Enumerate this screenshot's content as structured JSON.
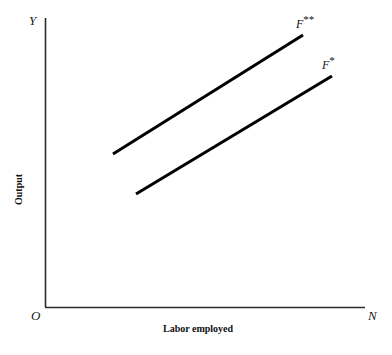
{
  "figure": {
    "background_color": "#ffffff",
    "width": 392,
    "height": 355,
    "axis_color": "#2b2b2b",
    "curve_color": "#000000"
  },
  "axes": {
    "y_endpoint_label": "Y",
    "x_endpoint_label": "N",
    "origin_label": "O",
    "y_title": "Output",
    "x_title": "Labor employed"
  },
  "curves": {
    "upper": {
      "label_base": "F",
      "label_stars": "**",
      "label_full": "F**"
    },
    "lower": {
      "label_base": "F",
      "label_stars": "*",
      "label_full": "F*"
    }
  },
  "chart_data": {
    "type": "line",
    "title": "",
    "xlabel": "Labor employed",
    "ylabel": "Output",
    "xlim": [
      0,
      1
    ],
    "ylim": [
      0,
      1
    ],
    "grid": false,
    "legend": "inline-end-labels",
    "axis_endpoint_labels": {
      "x": "N",
      "y": "Y",
      "origin": "O"
    },
    "annotations": [
      {
        "text": "F**",
        "x_px": 296,
        "y_px": 14
      },
      {
        "text": "F*",
        "x_px": 322,
        "y_px": 55
      }
    ],
    "series": [
      {
        "name": "F**",
        "description": "Upper production function (higher total factor productivity)",
        "x_px": [
          113,
          303
        ],
        "y_px": [
          154,
          35
        ],
        "x": [
          0.212,
          0.806
        ],
        "y": [
          0.529,
          0.941
        ],
        "line_width_px": 3,
        "color": "#000000"
      },
      {
        "name": "F*",
        "description": "Lower production function (baseline total factor productivity)",
        "x_px": [
          136,
          332
        ],
        "y_px": [
          194,
          76
        ],
        "x": [
          0.284,
          0.897
        ],
        "y": [
          0.391,
          0.799
        ],
        "line_width_px": 3,
        "color": "#000000"
      }
    ]
  }
}
